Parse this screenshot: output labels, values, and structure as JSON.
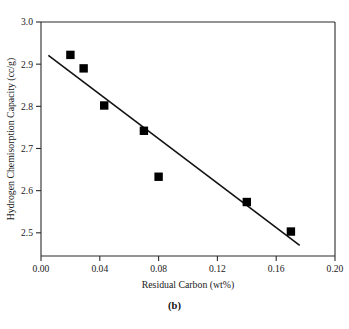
{
  "figure": {
    "caption": "(b)"
  },
  "chart_data": {
    "type": "scatter",
    "title": "",
    "xlabel": "Residual Carbon (wt%)",
    "ylabel": "Hydrogen Chemisorption Capacity (cc/g)",
    "xlim": [
      0.0,
      0.2
    ],
    "ylim": [
      2.445,
      3.0
    ],
    "grid": false,
    "legend": null,
    "xticks": [
      0.0,
      0.04,
      0.08,
      0.12,
      0.16,
      0.2
    ],
    "xtick_labels": [
      "0.00",
      "0.04",
      "0.08",
      "0.12",
      "0.16",
      "0.20"
    ],
    "yticks": [
      2.5,
      2.6,
      2.7,
      2.8,
      2.9,
      3.0
    ],
    "ytick_labels": [
      "2.5",
      "2.6",
      "2.7",
      "2.8",
      "2.9",
      "3.0"
    ],
    "marker": "square",
    "marker_color": "#000000",
    "points": [
      {
        "x": 0.02,
        "y": 2.922
      },
      {
        "x": 0.029,
        "y": 2.89
      },
      {
        "x": 0.043,
        "y": 2.802
      },
      {
        "x": 0.07,
        "y": 2.742
      },
      {
        "x": 0.08,
        "y": 2.633
      },
      {
        "x": 0.14,
        "y": 2.573
      },
      {
        "x": 0.17,
        "y": 2.503
      }
    ],
    "series": [
      {
        "name": "Hydrogen chemisorption capacity",
        "x": [
          0.02,
          0.029,
          0.043,
          0.07,
          0.08,
          0.14,
          0.17
        ],
        "values": [
          2.922,
          2.89,
          2.802,
          2.742,
          2.633,
          2.573,
          2.503
        ]
      }
    ],
    "trend_line": {
      "type": "linear-fit",
      "x_start": 0.005,
      "y_start": 2.921,
      "x_end": 0.176,
      "y_end": 2.47,
      "color": "#111111"
    }
  }
}
